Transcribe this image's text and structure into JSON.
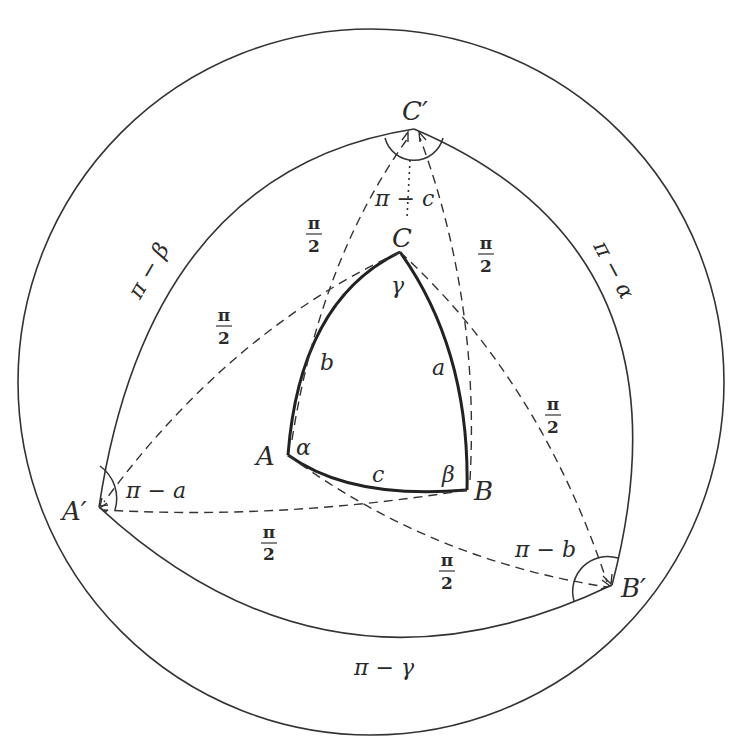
{
  "diagram": {
    "type": "spherical-polar-triangle",
    "colors": {
      "stroke": "#333333",
      "background": "#ffffff"
    },
    "outer_circle_label": "",
    "vertices": {
      "A": "A",
      "B": "B",
      "C": "C",
      "A_prime": "A′",
      "B_prime": "B′",
      "C_prime": "C′"
    },
    "sides": {
      "a": "a",
      "b": "b",
      "c": "c"
    },
    "angles": {
      "alpha": "α",
      "beta": "β",
      "gamma": "γ"
    },
    "polar_sides": {
      "pi_minus_alpha": "π − α",
      "pi_minus_beta": "π − β",
      "pi_minus_gamma": "π − γ"
    },
    "polar_angles": {
      "pi_minus_a": "π − a",
      "pi_minus_b": "π − b",
      "pi_minus_c": "π − c"
    },
    "right_angle_labels": {
      "num": "π",
      "den": "2"
    }
  }
}
